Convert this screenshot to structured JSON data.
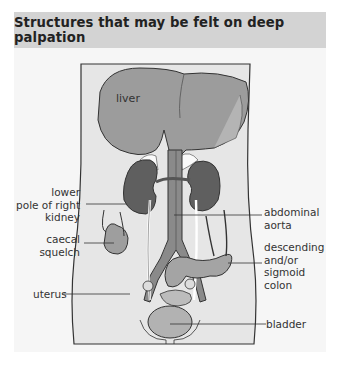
{
  "figure": {
    "title": "Structures that may be felt on deep palpation",
    "colors": {
      "header_bg": "#d3d3d3",
      "panel_bg": "#f6f6f6",
      "body_fill": "#e4e4e4",
      "liver": "#9a9a9a",
      "kidney": "#5e5e5e",
      "aorta": "#8a8a8a",
      "bowel": "#a8a8a8",
      "bladder": "#b2b2b2",
      "outline": "#333333"
    },
    "labels": {
      "liver": "liver",
      "kidney_line1": "lower",
      "kidney_line2": "pole of right",
      "kidney_line3": "kidney",
      "caecal_line1": "caecal",
      "caecal_line2": "squelch",
      "uterus": "uterus",
      "aorta_line1": "abdominal",
      "aorta_line2": "aorta",
      "colon_line1": "descending",
      "colon_line2": "and/or",
      "colon_line3": "sigmoid",
      "colon_line4": "colon",
      "bladder": "bladder"
    }
  }
}
